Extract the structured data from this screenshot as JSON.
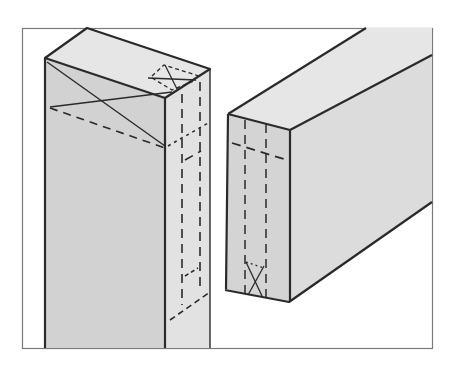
{
  "figure": {
    "frame_color": "#7a7a7a",
    "line_color": "#2a2a2a",
    "face_light": "#e3e3e3",
    "face_mid": "#d6d6d6",
    "face_dark": "#cdcdcd",
    "parts": [
      {
        "name": "post",
        "description": "Vertical post with mortise marked by dashed lines and X on end grain"
      },
      {
        "name": "rail",
        "description": "Horizontal rail with tenon marked by dashed lines and X on end"
      }
    ]
  }
}
